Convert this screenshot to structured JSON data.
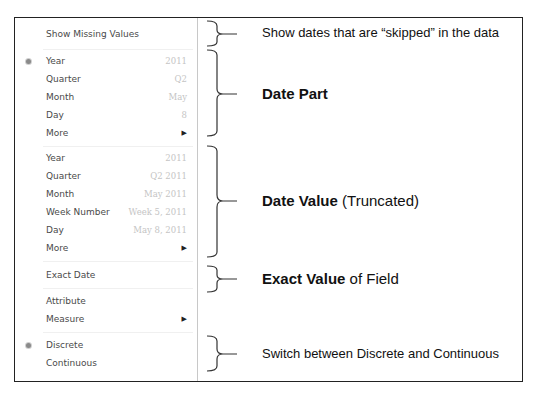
{
  "menu": {
    "show_missing_values": "Show Missing Values",
    "date_part": {
      "items": [
        {
          "label": "Year",
          "value": "2011",
          "selected": true
        },
        {
          "label": "Quarter",
          "value": "Q2"
        },
        {
          "label": "Month",
          "value": "May"
        },
        {
          "label": "Day",
          "value": "8"
        },
        {
          "label": "More",
          "submenu": true
        }
      ]
    },
    "date_value": {
      "items": [
        {
          "label": "Year",
          "value": "2011"
        },
        {
          "label": "Quarter",
          "value": "Q2 2011"
        },
        {
          "label": "Month",
          "value": "May 2011"
        },
        {
          "label": "Week Number",
          "value": "Week 5, 2011"
        },
        {
          "label": "Day",
          "value": "May 8, 2011"
        },
        {
          "label": "More",
          "submenu": true
        }
      ]
    },
    "exact_date": "Exact Date",
    "attribute": "Attribute",
    "measure": "Measure",
    "discrete": "Discrete",
    "continuous": "Continuous",
    "submenu_arrow": "▶"
  },
  "annotations": {
    "missing": "Show dates that are “skipped” in the data",
    "date_part_bold": "Date Part",
    "date_value_bold": "Date Value",
    "date_value_rest": " (Truncated)",
    "exact_bold": "Exact Value",
    "exact_rest": " of Field",
    "discrete_continuous": "Switch between Discrete and Continuous"
  }
}
